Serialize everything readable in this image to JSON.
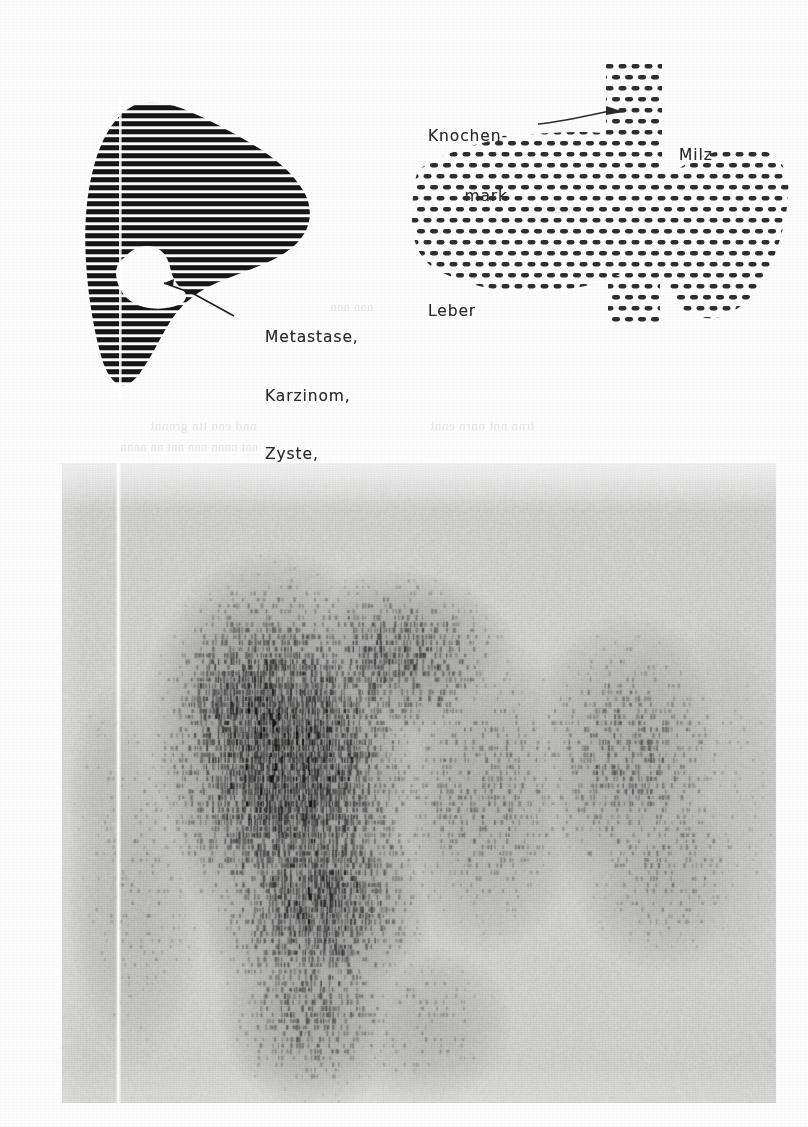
{
  "figure": {
    "kind": "scintigraphy-figure",
    "background_color": "#fdfdfd",
    "ink_color": "#1a1a1a",
    "label_color": "#2a2a2a"
  },
  "diagram_liver": {
    "name": "striped-liver-diagram",
    "pattern": "horizontal-stripes",
    "stripe_color": "#161616",
    "stripe_pitch_px": 8,
    "stripe_thickness_px": 5,
    "defect": {
      "name": "cold-lesion",
      "fill": "#ffffff",
      "label": "Metastase,\nKarzinom,\nZyste,\nAbszeß",
      "label_lines": [
        "Metastase,",
        "Karzinom,",
        "Zyste,",
        "Abszeß"
      ]
    },
    "midline_artifact": true
  },
  "diagram_organs": {
    "name": "dotted-organ-diagram",
    "pattern": "staggered-dots",
    "dot_color": "#2e2e2e",
    "dot_pitch_x_px": 13,
    "dot_pitch_y_px": 11,
    "dot_w_px": 8,
    "dot_h_px": 4,
    "labels": [
      {
        "key": "marrow",
        "text": "Knochen-\nmark",
        "lines": [
          "Knochen-",
          "mark"
        ],
        "leader": true
      },
      {
        "key": "spleen",
        "text": "Milz",
        "lines": [
          "Milz"
        ],
        "leader": false
      },
      {
        "key": "liver",
        "text": "Leber",
        "lines": [
          "Leber"
        ],
        "leader": false
      }
    ]
  },
  "scan": {
    "name": "scintiscan-photograph",
    "media": "grayscale-halftone-photograph",
    "base_gray": "#d3d3d2",
    "vertical_white_line": true,
    "hot_regions": [
      "liver-left-dense",
      "spleen-right-moderate"
    ]
  },
  "chart_data": {
    "type": "heatmap",
    "title": "",
    "xlabel": "",
    "ylabel": "",
    "grid": false,
    "legend": "none",
    "panels": [
      {
        "id": "liver-schematic",
        "render": "dense horizontal scan lines forming a liver silhouette with a white cold spot",
        "annotations": [
          "Metastase,",
          "Karzinom,",
          "Zyste,",
          "Abszeß"
        ]
      },
      {
        "id": "organ-schematic",
        "render": "staggered dot raster forming liver, spleen and a vertical bone-marrow/spine column",
        "annotations": [
          "Knochen-",
          "mark",
          "Milz",
          "Leber"
        ]
      },
      {
        "id": "scintiscan-photo",
        "render": "grey photographic scan, dark dot-density accumulation left of centre (liver) and moderate accumulation right (spleen)",
        "annotations": []
      }
    ]
  }
}
